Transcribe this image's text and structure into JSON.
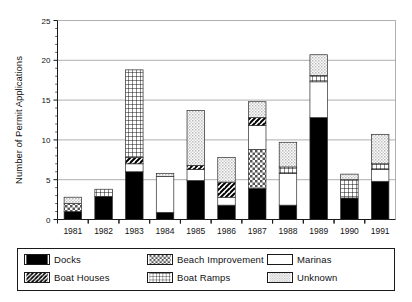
{
  "chart_data": {
    "type": "bar",
    "subtype": "stacked-vertical",
    "title": "",
    "xlabel": "",
    "ylabel": "Number of Permit Applications",
    "ylim": [
      0,
      25
    ],
    "ytick_labels": [
      "0",
      "5",
      "10",
      "15",
      "20",
      "25"
    ],
    "ytick_values": [
      0,
      5,
      10,
      15,
      20,
      25
    ],
    "yminor_step": 1,
    "grid": "horizontal-major",
    "legend_position": "below-plot",
    "categories": [
      "1981",
      "1982",
      "1983",
      "1984",
      "1985",
      "1986",
      "1987",
      "1988",
      "1989",
      "1990",
      "1991"
    ],
    "series": [
      {
        "name": "Docks",
        "fill": "solid-black",
        "values": [
          1.0,
          2.9,
          6.0,
          0.9,
          4.9,
          1.8,
          3.9,
          1.8,
          12.8,
          2.7,
          4.8
        ]
      },
      {
        "name": "Beach Improvement",
        "fill": "checker",
        "values": [
          1.0,
          0.0,
          0.0,
          0.0,
          0.0,
          0.0,
          4.9,
          0.0,
          0.0,
          0.0,
          0.0
        ]
      },
      {
        "name": "Marinas",
        "fill": "white",
        "values": [
          0.0,
          0.0,
          1.0,
          4.5,
          1.4,
          1.0,
          3.0,
          4.0,
          4.5,
          0.0,
          1.5
        ]
      },
      {
        "name": "Boat Houses",
        "fill": "diag-hatch",
        "values": [
          0.0,
          0.0,
          0.8,
          0.0,
          0.5,
          1.9,
          1.0,
          0.0,
          0.0,
          0.0,
          0.0
        ]
      },
      {
        "name": "Boat Ramps",
        "fill": "grid",
        "values": [
          0.0,
          0.9,
          11.0,
          0.0,
          0.0,
          0.0,
          0.0,
          0.8,
          0.8,
          2.3,
          0.7
        ]
      },
      {
        "name": "Unknown",
        "fill": "light-gray",
        "values": [
          0.8,
          0.0,
          0.0,
          0.4,
          6.9,
          3.1,
          2.0,
          3.1,
          2.6,
          0.7,
          3.7
        ]
      }
    ],
    "totals": [
      2.8,
      3.8,
      18.8,
      5.8,
      13.7,
      7.8,
      14.8,
      9.7,
      20.7,
      5.7,
      10.7
    ]
  },
  "legend": {
    "items": [
      {
        "label": "Docks",
        "fill": "solid-black"
      },
      {
        "label": "Boat Houses",
        "fill": "diag-hatch"
      },
      {
        "label": "Beach Improvement",
        "fill": "checker"
      },
      {
        "label": "Boat Ramps",
        "fill": "grid"
      },
      {
        "label": "Marinas",
        "fill": "white"
      },
      {
        "label": "Unknown",
        "fill": "light-gray"
      }
    ]
  },
  "colors": {
    "black": "#000000",
    "white": "#ffffff",
    "light_gray": "#d4d4d4",
    "outline": "#2b2b2b",
    "grid": "#8c8c8c",
    "text": "#111111"
  }
}
